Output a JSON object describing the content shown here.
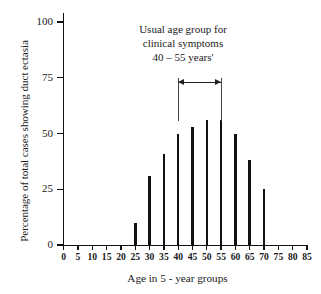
{
  "chart_data": {
    "type": "bar",
    "title": "",
    "xlabel": "Age in 5 - year groups",
    "ylabel": "Percentage of total cases showing duct ectasia",
    "categories": [
      0,
      5,
      10,
      15,
      20,
      25,
      30,
      35,
      40,
      45,
      50,
      55,
      60,
      65,
      70,
      75,
      80,
      85
    ],
    "values": [
      0,
      0,
      0,
      0,
      0,
      10,
      31,
      41,
      50,
      53,
      56,
      56,
      50,
      38,
      25,
      0,
      0,
      0
    ],
    "xlim": [
      0,
      85
    ],
    "ylim": [
      0,
      100
    ],
    "xticks": [
      "0",
      "5",
      "10",
      "15",
      "20",
      "25",
      "30",
      "35",
      "40",
      "45",
      "50",
      "55",
      "60",
      "65",
      "70",
      "75",
      "80",
      "85"
    ],
    "yticks": [
      "0",
      "25",
      "50",
      "75",
      "100"
    ],
    "ytick_values": [
      0,
      25,
      50,
      75,
      100
    ],
    "grid": false,
    "legend": null,
    "bar_color": "#111111",
    "annotations": [
      {
        "text_lines": [
          "Usual age group for",
          "clinical symptoms",
          "40 – 55 years'"
        ],
        "range_start": 40,
        "range_end": 55,
        "style": "double-headed-arrow-with-drop-lines"
      }
    ]
  }
}
